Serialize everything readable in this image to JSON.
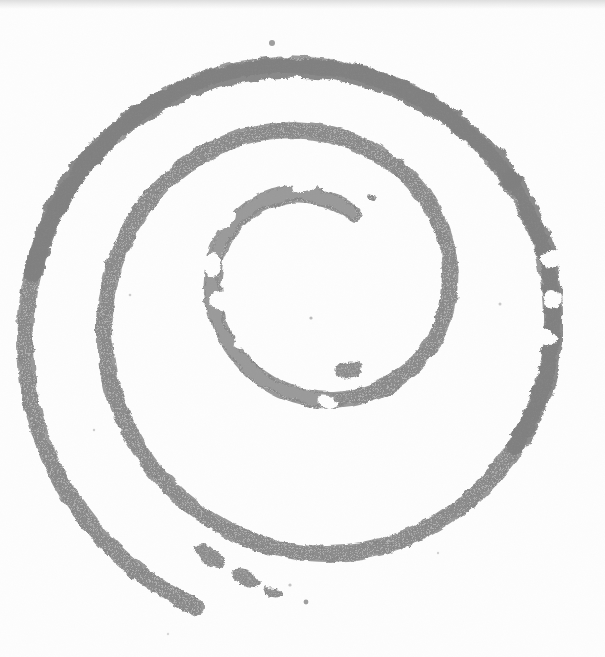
{
  "image": {
    "kind": "scanned-hand-drawn-artwork",
    "subject": "spiral",
    "width": 605,
    "height": 657,
    "background_color": "#fdfdfd",
    "stroke_color": "#8c8c8c",
    "stroke_color_light": "#9a9a9a",
    "stroke_color_dark": "#7f7f7f",
    "scan_band_color": "#c4c4c4",
    "description": "A single thick gray hand-drawn spiral of roughly two and a half turns, drawn with a broad dry marker on white paper and scanned. The stroke has rough, ragged, halftone-dithered edges, several small white holes and breaks, and the outer tail breaks into detached dashes toward the lower left before fading out."
  },
  "geometry": {
    "center_x": 300,
    "center_y": 305,
    "turns": 2.5,
    "start_angle_deg": -60,
    "inner_radius": 92,
    "outer_radius": 268,
    "stroke_width_inner": 11,
    "stroke_width_outer": 17,
    "outer_extent_left": 48,
    "outer_extent_right": 572,
    "outer_extent_top": 47,
    "tail_end_x": 300,
    "tail_end_y": 604
  },
  "specks": [
    {
      "cx": 272,
      "cy": 43,
      "r": 3.0
    },
    {
      "cx": 306,
      "cy": 602,
      "r": 2.4
    },
    {
      "cx": 311,
      "cy": 318,
      "r": 1.6
    },
    {
      "cx": 214,
      "cy": 309,
      "r": 1.4
    },
    {
      "cx": 367,
      "cy": 196,
      "r": 2.2
    },
    {
      "cx": 130,
      "cy": 295,
      "r": 1.3
    },
    {
      "cx": 500,
      "cy": 304,
      "r": 1.5
    },
    {
      "cx": 94,
      "cy": 430,
      "r": 1.2
    },
    {
      "cx": 290,
      "cy": 585,
      "r": 1.6
    }
  ],
  "holes": [
    {
      "cx": 287,
      "cy": 55,
      "rx": 5.5,
      "ry": 3.2,
      "rot": -12
    },
    {
      "cx": 88,
      "cy": 340,
      "rx": 4.2,
      "ry": 3.4,
      "rot": 20
    },
    {
      "cx": 119,
      "cy": 430,
      "rx": 2.6,
      "ry": 2.2,
      "rot": 0
    },
    {
      "cx": 380,
      "cy": 224,
      "rx": 6.0,
      "ry": 5.2,
      "rot": 35
    },
    {
      "cx": 72,
      "cy": 292,
      "rx": 3.0,
      "ry": 5.0,
      "rot": 8
    },
    {
      "cx": 551,
      "cy": 293,
      "rx": 4.0,
      "ry": 3.0,
      "rot": 0
    }
  ]
}
